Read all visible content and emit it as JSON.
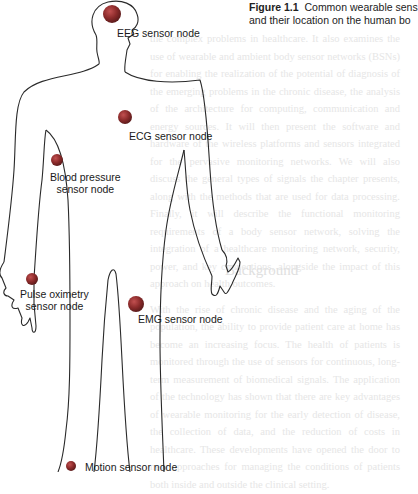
{
  "caption": {
    "figure_label": "Figure 1.1",
    "text_line1": "Common wearable sens",
    "text_line2": "and their location on the human bo"
  },
  "diagram": {
    "node_color": "#8a2a2a",
    "nodes": [
      {
        "id": "eeg",
        "label": "EEG sensor node",
        "location": "head"
      },
      {
        "id": "ecg",
        "label": "ECG sensor node",
        "location": "chest"
      },
      {
        "id": "bp",
        "label_line1": "Blood pressure",
        "label_line2": "sensor node",
        "location": "upper arm"
      },
      {
        "id": "spo2",
        "label_line1": "Pulse oximetry",
        "label_line2": "sensor node",
        "location": "hand"
      },
      {
        "id": "emg",
        "label": "EMG sensor node",
        "location": "thigh"
      },
      {
        "id": "motion",
        "label": "Motion sensor node",
        "location": "ankle"
      }
    ]
  },
  "background_text": {
    "paragraph1": "the complex problems in healthcare. It also examines the use of wearable and ambient body sensor networks (BSNs) for enabling the realization of the potential of diagnosis of the emerging problems in the chronic disease, the analysis of the architecture for computing, communication and energy sources. It will then present the software and hardware of the wireless platforms and sensors integrated for the pervasive monitoring networks. We will also discuss the general types of signals the chapter presents, along with the methods that are used for data processing. Finally, it will describe the functional monitoring requirements of a body sensor network, solving the integration of a healthcare monitoring network, security, power, and key connections, alongside the impact of this approach on health outcomes.",
    "heading": "Background",
    "paragraph2": "With the rise of chronic disease and the aging of the population, the ability to provide patient care at home has become an increasing focus. The health of patients is monitored through the use of sensors for continuous, long-term measurement of biomedical signals. The application of the technology has shown that there are key advantages of wearable monitoring for the early detection of disease, the collection of data, and the reduction of costs in healthcare. These developments have opened the door to new approaches for managing the conditions of patients both inside and outside the clinical setting."
  }
}
